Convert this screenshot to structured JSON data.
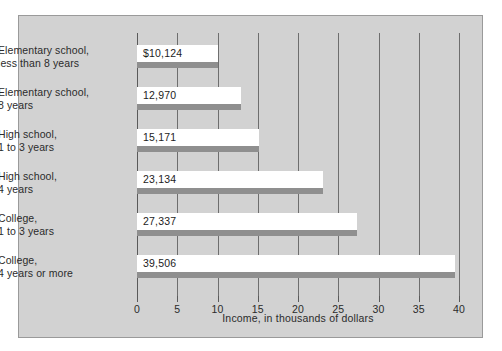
{
  "chart_data": {
    "type": "bar",
    "orientation": "horizontal",
    "title": "",
    "xlabel": "Income, in thousands of dollars",
    "ylabel": "",
    "xlim": [
      0,
      40
    ],
    "xticks": [
      0,
      5,
      10,
      15,
      20,
      25,
      30,
      35,
      40
    ],
    "xtick_labels": [
      "0",
      "5",
      "10",
      "15",
      "20",
      "25",
      "30",
      "35",
      "40"
    ],
    "grid": true,
    "legend": null,
    "units": "thousands of dollars",
    "categories": [
      "Elementary school, less than 8 years",
      "Elementary school, 8 years",
      "High school, 1 to 3 years",
      "High school, 4 years",
      "College, 1 to 3 years",
      "College, 4 years or more"
    ],
    "category_lines": [
      [
        "Elementary school,",
        "less than 8 years"
      ],
      [
        "Elementary school,",
        "8 years"
      ],
      [
        "High school,",
        "1 to 3 years"
      ],
      [
        "High school,",
        "4 years"
      ],
      [
        "College,",
        "1 to 3 years"
      ],
      [
        "College,",
        "4 years or more"
      ]
    ],
    "values": [
      10.124,
      12.97,
      15.171,
      23.134,
      27.337,
      39.506
    ],
    "data_labels": [
      "$10,124",
      "12,970",
      "15,171",
      "23,134",
      "27,337",
      "39,506"
    ],
    "colors": {
      "panel_background": "#d2d2d2",
      "panel_border": "#9a9a9a",
      "bar_fill": "#ffffff",
      "bar_shadow": "#8f8f8f",
      "gridline": "#6e6e6e",
      "axis": "#5a5a5a",
      "text": "#2b2b2b",
      "figure_background": "#ffffff"
    }
  }
}
